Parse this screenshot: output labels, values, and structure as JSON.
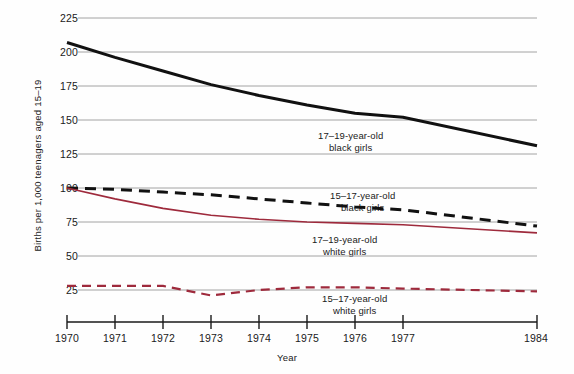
{
  "chart_data": {
    "type": "line",
    "title": "",
    "xlabel": "Year",
    "ylabel": "Births per 1,000 teenagers aged 15–19",
    "xlim": [
      1970,
      1984
    ],
    "ylim": [
      0,
      225
    ],
    "grid": true,
    "grid_axis": "y",
    "legend": "inline-annotations",
    "y_ticks": [
      225,
      200,
      175,
      150,
      125,
      100,
      75,
      50,
      25
    ],
    "y_tick_labels": [
      "225",
      "200",
      "175",
      "150",
      "125",
      "100",
      "75",
      "50",
      "25"
    ],
    "x_ticks": [
      1970,
      1971,
      1972,
      1973,
      1974,
      1975,
      1976,
      1977,
      1984
    ],
    "x_tick_labels": [
      "1970",
      "1971",
      "1972",
      "1973",
      "1974",
      "1975",
      "1976",
      "1977",
      "1984"
    ],
    "x": [
      1970,
      1971,
      1972,
      1973,
      1974,
      1975,
      1976,
      1977,
      1984
    ],
    "series": [
      {
        "name": "17–19-year-old black girls",
        "label_line1": "17–19-year-old",
        "label_line2": "black girls",
        "color": "#111111",
        "style": "solid",
        "width": 3.0,
        "values": [
          207,
          196,
          186,
          176,
          168,
          161,
          155,
          152,
          131
        ]
      },
      {
        "name": "15–17-year-old black girls",
        "label_line1": "15–17-year-old",
        "label_line2": "black girls",
        "color": "#111111",
        "style": "dashed",
        "width": 3.0,
        "values": [
          100,
          99,
          97,
          95,
          92,
          89,
          86,
          84,
          72
        ]
      },
      {
        "name": "17–19-year-old white girls",
        "label_line1": "17–19-year-old",
        "label_line2": "white girls",
        "color": "#9e2a3c",
        "style": "solid",
        "width": 1.6,
        "values": [
          100,
          92,
          85,
          80,
          77,
          75,
          74,
          73,
          67
        ]
      },
      {
        "name": "15–17-year-old white girls",
        "label_line1": "15–17-year-old",
        "label_line2": "white girls",
        "color": "#9e2a3c",
        "style": "dashed",
        "width": 2.2,
        "values": [
          28,
          28,
          28,
          21,
          25,
          27,
          27,
          26,
          24
        ]
      }
    ],
    "annotations": [
      {
        "text": "17–19-year-old black girls",
        "near_x": 1976,
        "near_y": 140
      },
      {
        "text": "15–17-year-old black girls",
        "near_x": 1976,
        "near_y": 92
      },
      {
        "text": "17–19-year-old white girls",
        "near_x": 1976,
        "near_y": 66
      },
      {
        "text": "15–17-year-old white girls",
        "near_x": 1977,
        "near_y": 16
      }
    ],
    "colors": {
      "black_series": "#111111",
      "red_series": "#9e2a3c",
      "gridline": "#9a9a9a",
      "axis": "#1a1a1a",
      "background": "#fefefe"
    }
  }
}
